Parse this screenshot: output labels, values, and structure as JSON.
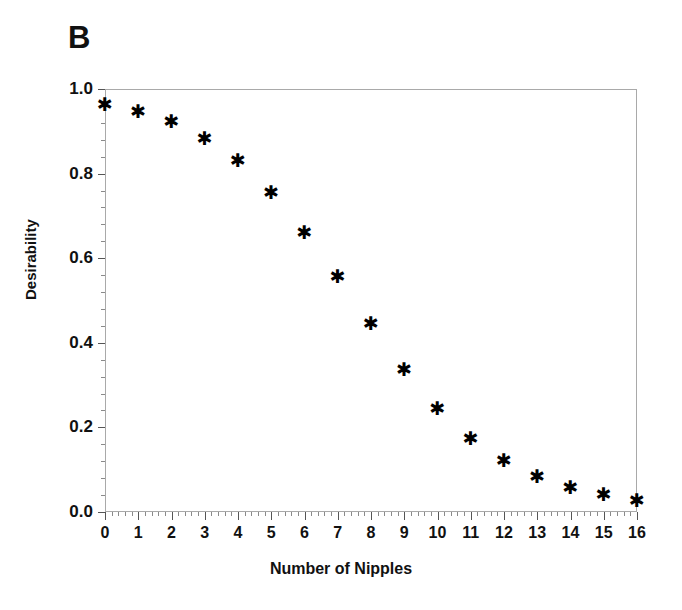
{
  "panel": {
    "label": "B"
  },
  "chart_data": {
    "type": "scatter",
    "title": "",
    "xlabel": "Number of Nipples",
    "ylabel": "Desirability",
    "xlim": [
      0,
      16
    ],
    "ylim": [
      0.0,
      1.0
    ],
    "grid": false,
    "legend": null,
    "marker": "asterisk",
    "marker_color": "#000000",
    "frame_color": "#a9a9a9",
    "x": [
      0,
      1,
      2,
      3,
      4,
      5,
      6,
      7,
      8,
      9,
      10,
      11,
      12,
      13,
      14,
      15,
      16
    ],
    "values": [
      0.965,
      0.948,
      0.925,
      0.885,
      0.832,
      0.757,
      0.663,
      0.558,
      0.447,
      0.339,
      0.247,
      0.176,
      0.122,
      0.085,
      0.059,
      0.043,
      0.028
    ],
    "series": [
      {
        "name": "Desirability",
        "values": [
          0.965,
          0.948,
          0.925,
          0.885,
          0.832,
          0.757,
          0.663,
          0.558,
          0.447,
          0.339,
          0.247,
          0.176,
          0.122,
          0.085,
          0.059,
          0.043,
          0.028
        ]
      }
    ],
    "x_tick_labels": [
      "0",
      "1",
      "2",
      "3",
      "4",
      "5",
      "6",
      "7",
      "8",
      "9",
      "10",
      "11",
      "12",
      "13",
      "14",
      "15",
      "16"
    ],
    "x_tick_values": [
      0,
      1,
      2,
      3,
      4,
      5,
      6,
      7,
      8,
      9,
      10,
      11,
      12,
      13,
      14,
      15,
      16
    ],
    "x_minor_ticks_per_interval": 4,
    "y_tick_labels": [
      "0.0",
      "0.2",
      "0.4",
      "0.6",
      "0.8",
      "1.0"
    ],
    "y_tick_values": [
      0.0,
      0.2,
      0.4,
      0.6,
      0.8,
      1.0
    ],
    "y_minor_ticks_per_interval": 4
  }
}
